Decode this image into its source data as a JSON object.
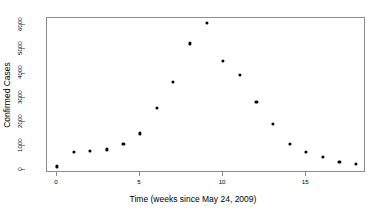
{
  "chart_data": {
    "type": "scatter",
    "title": "",
    "xlabel": "Time (weeks since May 24, 2009)",
    "ylabel": "Confirmed Cases",
    "xlim": [
      -0.6,
      18.6
    ],
    "ylim": [
      -120,
      6300
    ],
    "grid": false,
    "legend": null,
    "xticks": [
      0,
      5,
      10,
      15
    ],
    "xtick_labels": [
      "0",
      "5",
      "10",
      "15"
    ],
    "yticks": [
      0,
      1000,
      2000,
      3000,
      4000,
      5000,
      6000
    ],
    "ytick_labels": [
      "0",
      "1000",
      "2000",
      "3000",
      "4000",
      "5000",
      "6000"
    ],
    "x": [
      0,
      1,
      2,
      3,
      4,
      5,
      6,
      7,
      8,
      9,
      10,
      11,
      12,
      13,
      14,
      15,
      16,
      17,
      18
    ],
    "y": [
      150,
      760,
      790,
      860,
      1090,
      1520,
      2560,
      3650,
      5250,
      6100,
      4520,
      3930,
      2810,
      1910,
      1100,
      760,
      540,
      330,
      260
    ],
    "point_color": "#000000",
    "point_marker": "circle",
    "axis_color": "#8c8c8c",
    "background_color": "#ffffff"
  },
  "figure": {
    "y_axis_title": "Confirmed Cases",
    "x_axis_title": "Time (weeks since May 24, 2009)"
  }
}
